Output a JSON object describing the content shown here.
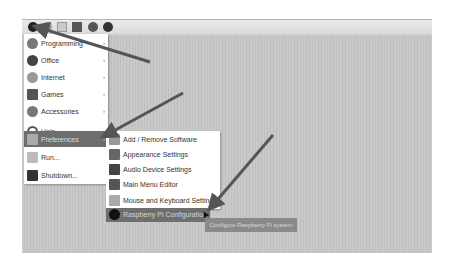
{
  "taskbar": {
    "icons": [
      "raspberry-menu-icon",
      "web-browser-icon",
      "file-manager-icon",
      "terminal-icon",
      "wolfram-icon",
      "mathematica-icon"
    ]
  },
  "main_menu": {
    "items": [
      {
        "label": "Programming",
        "icon": "programming-icon",
        "has_submenu": true
      },
      {
        "label": "Office",
        "icon": "office-icon",
        "has_submenu": true
      },
      {
        "label": "Internet",
        "icon": "internet-icon",
        "has_submenu": true
      },
      {
        "label": "Games",
        "icon": "games-icon",
        "has_submenu": true
      },
      {
        "label": "Accessories",
        "icon": "accessories-icon",
        "has_submenu": true
      },
      {
        "label": "Help",
        "icon": "help-icon",
        "has_submenu": true
      },
      {
        "label": "Preferences",
        "icon": "preferences-icon",
        "has_submenu": true,
        "active": true
      },
      {
        "label": "Run...",
        "icon": "run-icon",
        "has_submenu": false
      },
      {
        "label": "Shutdown...",
        "icon": "shutdown-icon",
        "has_submenu": false
      }
    ],
    "submenu_arrow": "›"
  },
  "preferences_submenu": {
    "items": [
      {
        "label": "Add / Remove Software",
        "icon": "add-remove-software-icon"
      },
      {
        "label": "Appearance Settings",
        "icon": "appearance-settings-icon"
      },
      {
        "label": "Audio Device Settings",
        "icon": "audio-device-settings-icon"
      },
      {
        "label": "Main Menu Editor",
        "icon": "main-menu-editor-icon"
      },
      {
        "label": "Mouse and Keyboard Settings",
        "icon": "mouse-keyboard-settings-icon"
      },
      {
        "label": "Raspberry Pi Configuration",
        "icon": "raspberry-pi-configuration-icon",
        "active": true
      }
    ]
  },
  "tooltip": {
    "text": "Configure Raspberry Pi system"
  },
  "colors": {
    "desktop": "#c6c6c6",
    "highlight": "#6e6e6e",
    "annotation_arrow": "#555555"
  }
}
